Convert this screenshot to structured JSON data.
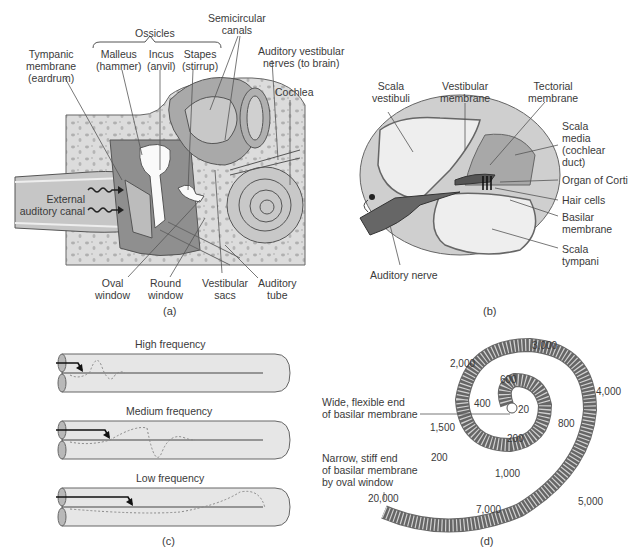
{
  "panel_a": {
    "caption": "(a)",
    "ossicles_group": "Ossicles",
    "labels": {
      "tympanic_membrane": [
        "Tympanic",
        "membrane",
        "(eardrum)"
      ],
      "malleus": [
        "Malleus",
        "(hammer)"
      ],
      "incus": [
        "Incus",
        "(anvil)"
      ],
      "stapes": [
        "Stapes",
        "(stirrup)"
      ],
      "semicircular_canals": [
        "Semicircular",
        "canals"
      ],
      "auditory_vestibular_nerves": [
        "Auditory vestibular",
        "nerves (to brain)"
      ],
      "cochlea": "Cochlea",
      "external_auditory_canal": [
        "External",
        "auditory canal"
      ],
      "oval_window": [
        "Oval",
        "window"
      ],
      "round_window": [
        "Round",
        "window"
      ],
      "vestibular_sacs": [
        "Vestibular",
        "sacs"
      ],
      "auditory_tube": [
        "Auditory",
        "tube"
      ]
    }
  },
  "panel_b": {
    "caption": "(b)",
    "labels": {
      "scala_vestibuli": [
        "Scala",
        "vestibuli"
      ],
      "vestibular_membrane": [
        "Vestibular",
        "membrane"
      ],
      "tectorial_membrane": [
        "Tectorial",
        "membrane"
      ],
      "scala_media": [
        "Scala",
        "media",
        "(cochlear",
        "duct)"
      ],
      "organ_of_corti": "Organ of Corti",
      "hair_cells": "Hair cells",
      "basilar_membrane": [
        "Basilar",
        "membrane"
      ],
      "scala_tympani": [
        "Scala",
        "tympani"
      ],
      "auditory_nerve": "Auditory nerve"
    }
  },
  "panel_c": {
    "caption": "(c)",
    "tubes": [
      {
        "label": "High frequency"
      },
      {
        "label": "Medium frequency"
      },
      {
        "label": "Low frequency"
      }
    ]
  },
  "panel_d": {
    "caption": "(d)",
    "wide_end": [
      "Wide, flexible end",
      "of basilar membrane"
    ],
    "narrow_end": [
      "Narrow, stiff end",
      "of basilar membrane",
      "by oval window"
    ],
    "frequencies_hz": [
      "20",
      "200",
      "400",
      "600",
      "800",
      "1,000",
      "1,500",
      "2,000",
      "3,000",
      "4,000",
      "5,000",
      "7,000",
      "20,000"
    ],
    "stray_label": "200"
  },
  "colors": {
    "bone": "#d9d9d9",
    "bone_spot": "#b3b3b3",
    "tissue_dark": "#9e9e9e",
    "tissue_mid": "#bdbdbd",
    "fluid_light": "#ededed",
    "line": "#444444"
  }
}
